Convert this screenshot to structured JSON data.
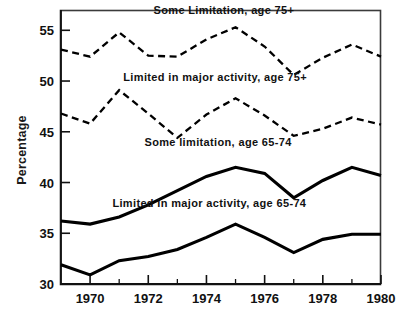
{
  "chart_data": {
    "type": "line",
    "title": "",
    "xlabel": "",
    "ylabel": "Percentage",
    "xlim": [
      1969,
      1980
    ],
    "ylim": [
      30,
      57
    ],
    "grid": false,
    "legend_position": "inline-annotations",
    "x": [
      1969,
      1970,
      1971,
      1972,
      1973,
      1974,
      1975,
      1976,
      1977,
      1978,
      1979,
      1980
    ],
    "y_ticks": [
      30,
      35,
      40,
      45,
      50,
      55
    ],
    "y_tick_labels": [
      "30",
      "35",
      "40",
      "45",
      "50",
      "55"
    ],
    "x_ticks": [
      1970,
      1972,
      1974,
      1976,
      1978,
      1980
    ],
    "x_tick_labels": [
      "1970",
      "1972",
      "1974",
      "1976",
      "1978",
      "1980"
    ],
    "x_minor_ticks": [
      1969,
      1971,
      1973,
      1975,
      1977,
      1979
    ],
    "series": [
      {
        "name": "Some Limitation, age 75+",
        "style": "dashed",
        "values": [
          53.1,
          52.4,
          54.8,
          52.5,
          52.4,
          54.1,
          55.3,
          53.4,
          50.6,
          52.3,
          53.6,
          52.4
        ]
      },
      {
        "name": "Limited in major activity, age 75+",
        "style": "dashed",
        "values": [
          46.8,
          45.8,
          49.1,
          46.8,
          44.4,
          46.7,
          48.3,
          46.6,
          44.6,
          45.3,
          46.4,
          45.7
        ]
      },
      {
        "name": "Some limitation, age 65-74",
        "style": "solid",
        "values": [
          36.2,
          35.9,
          36.6,
          37.8,
          39.2,
          40.6,
          41.5,
          40.9,
          38.5,
          40.2,
          41.5,
          40.7
        ]
      },
      {
        "name": "Limited in major activity, age 65-74",
        "style": "solid",
        "values": [
          31.9,
          30.9,
          32.3,
          32.7,
          33.4,
          34.6,
          35.9,
          34.6,
          33.1,
          34.4,
          34.9,
          34.9
        ]
      }
    ],
    "annotations": [
      {
        "text": "Some Limitation, age 75+",
        "x": 1974.6,
        "y": 56.6,
        "anchor": "middle"
      },
      {
        "text": "Limited in major activity, age 75+",
        "x": 1974.3,
        "y": 50.0,
        "anchor": "middle"
      },
      {
        "text": "Some limitation, age 65-74",
        "x": 1974.4,
        "y": 43.6,
        "anchor": "middle"
      },
      {
        "text": "Limited in major activity, age 65-74",
        "x": 1974.1,
        "y": 37.6,
        "anchor": "middle"
      }
    ]
  }
}
